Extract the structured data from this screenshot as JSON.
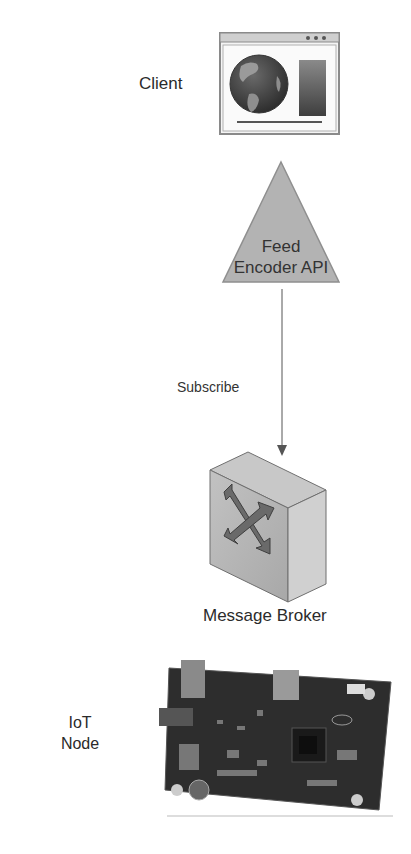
{
  "diagram": {
    "nodes": {
      "client": {
        "label": "Client",
        "icon": "browser-globe-icon"
      },
      "feed_encoder": {
        "label_line1": "Feed",
        "label_line2": "Encoder API",
        "shape": "triangle"
      },
      "message_broker": {
        "label": "Message Broker",
        "icon": "switch-box-icon"
      },
      "iot_node": {
        "label_line1": "IoT",
        "label_line2": "Node",
        "icon": "circuit-board-icon"
      }
    },
    "edges": [
      {
        "from": "feed_encoder",
        "to": "message_broker",
        "label": "Subscribe"
      }
    ],
    "colors": {
      "triangle_fill": "#b3b3b3",
      "box_fill": "#bdbdbd",
      "line": "#555555"
    }
  }
}
